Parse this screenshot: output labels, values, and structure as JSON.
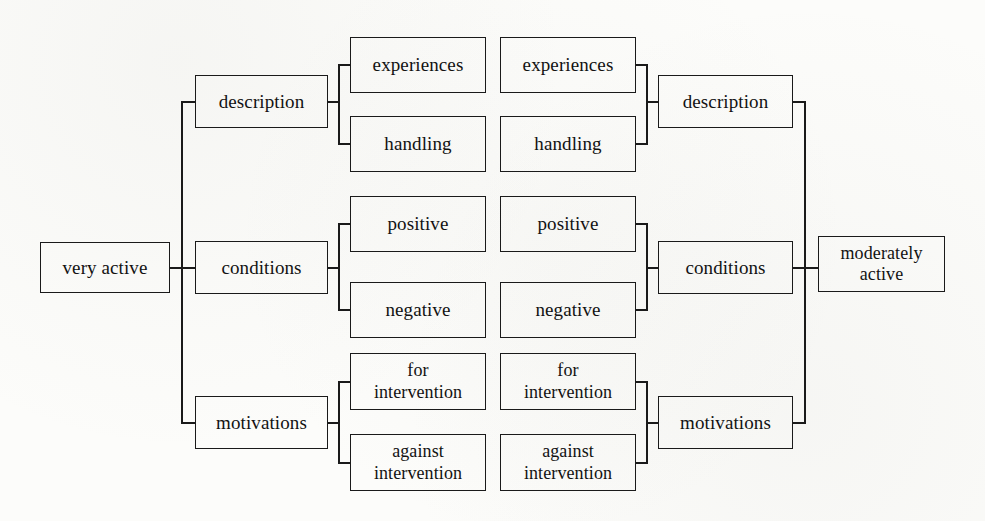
{
  "diagram": {
    "type": "mirrored-hierarchy-tree",
    "title": "",
    "roots": {
      "left": "very active",
      "right": "moderately active"
    },
    "branch_labels": {
      "description": "description",
      "conditions": "conditions",
      "motivations": "motivations"
    },
    "leaf_labels": {
      "experiences": "experiences",
      "handling": "handling",
      "positive": "positive",
      "negative": "negative",
      "for_intervention": "for\nintervention",
      "against_intervention": "against\nintervention"
    },
    "nodes": {
      "left_root": "very active",
      "left_description": "description",
      "left_conditions": "conditions",
      "left_motivations": "motivations",
      "left_experiences": "experiences",
      "left_handling": "handling",
      "left_positive": "positive",
      "left_negative": "negative",
      "left_for_intervention": "for\nintervention",
      "left_against_intervention": "against\nintervention",
      "right_experiences": "experiences",
      "right_handling": "handling",
      "right_positive": "positive",
      "right_negative": "negative",
      "right_for_intervention": "for\nintervention",
      "right_against_intervention": "against\nintervention",
      "right_description": "description",
      "right_conditions": "conditions",
      "right_motivations": "motivations",
      "right_root": "moderately active"
    },
    "colors": {
      "line": "#1a1a1a",
      "text": "#121212",
      "background": "#fcfcfa"
    }
  }
}
